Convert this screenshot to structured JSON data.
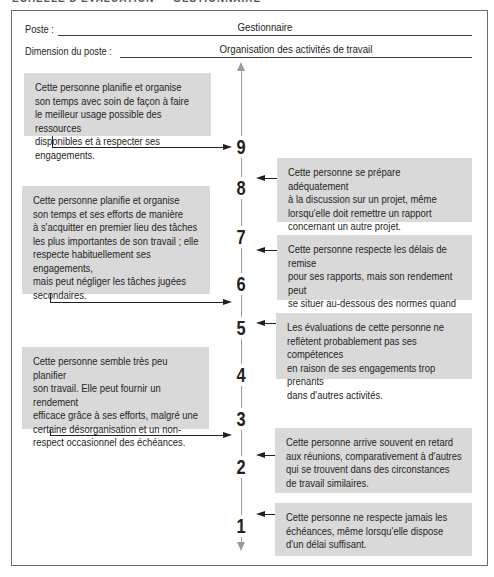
{
  "page": {
    "clipped_heading": "ÉCHELLE D'ÉVALUATION — GESTIONNAIRE"
  },
  "header": {
    "poste_label": "Poste :",
    "poste_value": "Gestionnaire",
    "dimension_label": "Dimension du poste :",
    "dimension_value": "Organisation des activités de travail"
  },
  "scale": {
    "ticks": [
      "9",
      "8",
      "7",
      "6",
      "5",
      "4",
      "3",
      "2",
      "1"
    ],
    "axis_color": "#9a9a9a",
    "box_color": "#d9d9d9"
  },
  "anchors_left": [
    {
      "level": "9",
      "text": "Cette personne planifie et organise\nson temps avec soin de façon à faire\nle meilleur usage possible des ressources\ndisponibles et à respecter ses engagements."
    },
    {
      "level": "6",
      "text": "Cette personne planifie et organise\nson temps et ses efforts de manière\nà s'acquitter en premier lieu des tâches\nles plus importantes de son travail ; elle\nrespecte habituellement ses engagements,\nmais peut négliger les tâches jugées\nsecondaires."
    },
    {
      "level": "3",
      "text": "Cette personne semble très peu planifier\nson travail. Elle peut fournir un rendement\nefficace grâce à ses efforts, malgré une\ncertaine désorganisation et un non-\nrespect occasionnel des échéances."
    }
  ],
  "anchors_right": [
    {
      "level": "8",
      "text": "Cette personne se prépare adéquatement\nà la discussion sur un projet, même\nlorsqu'elle doit remettre un rapport\nconcernant un autre projet."
    },
    {
      "level": "7",
      "text": "Cette personne respecte les délais de remise\npour ses rapports, mais son rendement peut\nse situer au-dessous des normes quand\nplusieurs échéances coïncident."
    },
    {
      "level": "5",
      "text": "Les évaluations de cette personne ne\nreflètent probablement pas ses compétences\nen raison de ses engagements trop prenants\ndans d'autres activités."
    },
    {
      "level": "2",
      "text": "Cette personne arrive souvent en retard\naux réunions, comparativement à d'autres\nqui se trouvent dans des circonstances\nde travail similaires."
    },
    {
      "level": "1",
      "text": "Cette personne ne respecte jamais les\néchéances, même lorsqu'elle dispose\nd'un délai suffisant."
    }
  ]
}
